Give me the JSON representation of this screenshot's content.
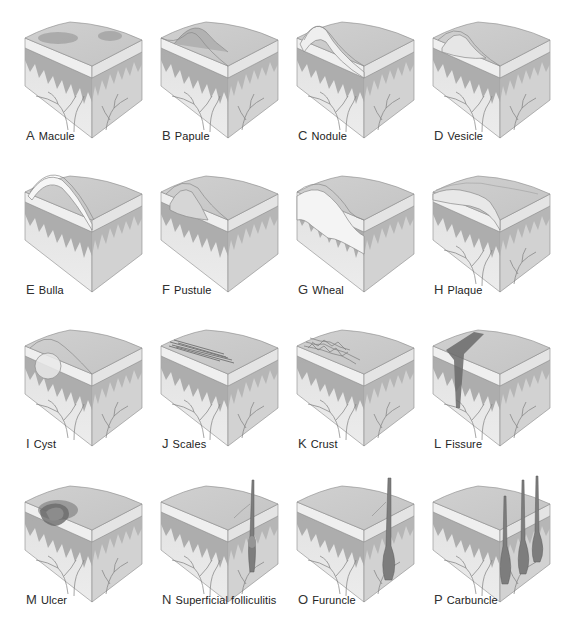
{
  "figure": {
    "colors": {
      "surface": "#c4c4c4",
      "surface_shadow": "#a9a9a9",
      "epidermis": "#efefef",
      "dermis_band": "#a6a6a6",
      "dermis": "#e2e2e2",
      "dermis_right": "#d2d2d2",
      "outline": "#8a8a8a",
      "vessel": "#7c7c7c",
      "lesion_dark": "#6f6f6f",
      "fluid": "#e6e6e6"
    },
    "lesions": [
      {
        "letter": "A",
        "name": "Macule",
        "type": "macule"
      },
      {
        "letter": "B",
        "name": "Papule",
        "type": "papule"
      },
      {
        "letter": "C",
        "name": "Nodule",
        "type": "nodule"
      },
      {
        "letter": "D",
        "name": "Vesicle",
        "type": "vesicle"
      },
      {
        "letter": "E",
        "name": "Bulla",
        "type": "bulla"
      },
      {
        "letter": "F",
        "name": "Pustule",
        "type": "pustule"
      },
      {
        "letter": "G",
        "name": "Wheal",
        "type": "wheal"
      },
      {
        "letter": "H",
        "name": "Plaque",
        "type": "plaque"
      },
      {
        "letter": "I",
        "name": "Cyst",
        "type": "cyst"
      },
      {
        "letter": "J",
        "name": "Scales",
        "type": "scales"
      },
      {
        "letter": "K",
        "name": "Crust",
        "type": "crust"
      },
      {
        "letter": "L",
        "name": "Fissure",
        "type": "fissure"
      },
      {
        "letter": "M",
        "name": "Ulcer",
        "type": "ulcer"
      },
      {
        "letter": "N",
        "name": "Superficial folliculitis",
        "type": "folliculitis"
      },
      {
        "letter": "O",
        "name": "Furuncle",
        "type": "furuncle"
      },
      {
        "letter": "P",
        "name": "Carbuncle",
        "type": "carbuncle"
      }
    ]
  }
}
